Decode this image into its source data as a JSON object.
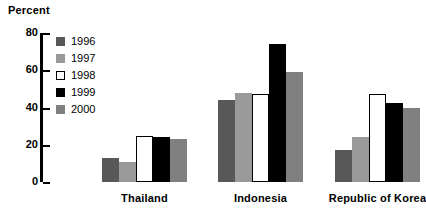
{
  "chart_data": {
    "type": "bar",
    "title": "Percent",
    "xlabel": "",
    "ylabel": "Percent",
    "ylim": [
      0,
      80
    ],
    "yticks": [
      0,
      20,
      40,
      60,
      80
    ],
    "grid": false,
    "legend_position": "inside-top-left",
    "categories": [
      "Thailand",
      "Indonesia",
      "Republic of Korea"
    ],
    "series": [
      {
        "name": "1996",
        "color": "#585858",
        "values": [
          13,
          44,
          17
        ]
      },
      {
        "name": "1997",
        "color": "#9a9a9a",
        "values": [
          11,
          48,
          24
        ]
      },
      {
        "name": "1998",
        "color": "#ffffff",
        "values": [
          24.5,
          47,
          47
        ]
      },
      {
        "name": "1999",
        "color": "#000000",
        "values": [
          24,
          74,
          42.5
        ]
      },
      {
        "name": "2000",
        "color": "#808080",
        "values": [
          23,
          59,
          39.5
        ]
      }
    ]
  },
  "axis": {
    "tick_labels": [
      "80",
      "60",
      "40",
      "20",
      "0"
    ]
  },
  "legend": {
    "items": [
      {
        "label": "1996"
      },
      {
        "label": "1997"
      },
      {
        "label": "1998"
      },
      {
        "label": "1999"
      },
      {
        "label": "2000"
      }
    ]
  }
}
